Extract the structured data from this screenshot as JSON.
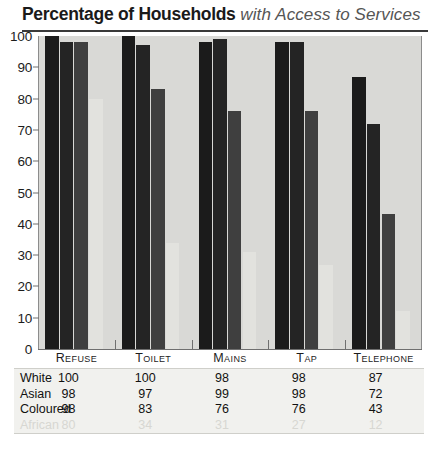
{
  "title": {
    "main": "Percentage of Households",
    "sub": " with Access to Services"
  },
  "chart_data": {
    "type": "bar",
    "title": "Percentage of Households with Access to Services",
    "xlabel": "",
    "ylabel": "",
    "ylim": [
      0,
      100
    ],
    "yticks": [
      "0",
      "10",
      "20",
      "30",
      "40",
      "50",
      "60",
      "70",
      "80",
      "90",
      "100"
    ],
    "grid": false,
    "legend_position": "table-below",
    "categories": [
      "Refuse",
      "Toilet",
      "Mains",
      "Tap",
      "Telephone"
    ],
    "series": [
      {
        "name": "White",
        "values": [
          100,
          100,
          98,
          98,
          87
        ],
        "color": "#1b1b1b",
        "faded": false
      },
      {
        "name": "Asian",
        "values": [
          98,
          97,
          99,
          98,
          72
        ],
        "color": "#242424",
        "faded": false
      },
      {
        "name": "Coloured",
        "values": [
          98,
          83,
          76,
          76,
          43
        ],
        "color": "#3f3f3f",
        "faded": false
      },
      {
        "name": "African",
        "values": [
          80,
          34,
          31,
          27,
          12
        ],
        "color": "#e2e2de",
        "faded": true
      }
    ]
  }
}
